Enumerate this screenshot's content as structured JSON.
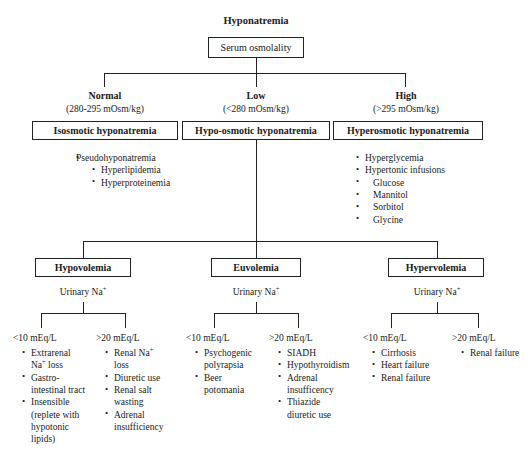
{
  "title": "Hyponatremia",
  "root_box": "Serum osmolality",
  "osmolality_branches": [
    {
      "label": "Normal",
      "range": "(280-295 mOsm/kg)"
    },
    {
      "label": "Low",
      "range": "(<280 mOsm/kg)"
    },
    {
      "label": "High",
      "range": "(>295 mOsm/kg)"
    }
  ],
  "category_boxes": [
    {
      "label": "Isosmotic hyponatremia"
    },
    {
      "label": "Hypo-osmotic hyponatremia"
    },
    {
      "label": "Hyperosmotic hyponatremia"
    }
  ],
  "isosmotic_list": [
    {
      "text": "Pseudohyponatremia",
      "style": "plain"
    },
    {
      "text": "Hyperlipidemia",
      "style": "bullet"
    },
    {
      "text": "Hyperproteinemia",
      "style": "bullet"
    }
  ],
  "hyperosmotic_list": [
    {
      "text": "Hyperglycemia",
      "style": "bullet"
    },
    {
      "text": "Hypertonic infusions",
      "style": "bullet"
    },
    {
      "text": "Glucose",
      "style": "sub"
    },
    {
      "text": "Mannitol",
      "style": "sub"
    },
    {
      "text": "Sorbitol",
      "style": "sub"
    },
    {
      "text": "Glycine",
      "style": "sub"
    }
  ],
  "volume_boxes": [
    {
      "label": "Hypovolemia"
    },
    {
      "label": "Euvolemia"
    },
    {
      "label": "Hypervolemia"
    }
  ],
  "urinary_na_label": "Urinary Na",
  "urinary_na_sup": "+",
  "thresholds": {
    "low": "<10 mEq/L",
    "high": ">20 mEq/L"
  },
  "columns": {
    "hypovolemia": {
      "low": [
        {
          "lines": [
            "Extrarenal",
            "Na⁺ loss"
          ],
          "style": "bullet"
        },
        {
          "lines": [
            "Gastro-",
            "intestinal tract"
          ],
          "style": "bullet"
        },
        {
          "lines": [
            "Insensible",
            "(replete with",
            "hypotonic",
            "lipids)"
          ],
          "style": "bullet"
        }
      ],
      "high": [
        {
          "lines": [
            "Renal Na⁺",
            "loss"
          ],
          "style": "bullet"
        },
        {
          "lines": [
            "Diuretic use"
          ],
          "style": "bullet"
        },
        {
          "lines": [
            "Renal salt",
            "wasting"
          ],
          "style": "bullet"
        },
        {
          "lines": [
            "Adrenal",
            "insufficiency"
          ],
          "style": "bullet"
        }
      ]
    },
    "euvolemia": {
      "low": [
        {
          "lines": [
            "Psychogenic",
            "polyrapsia"
          ],
          "style": "bullet"
        },
        {
          "lines": [
            "Beer",
            "potomania"
          ],
          "style": "bullet"
        }
      ],
      "high": [
        {
          "lines": [
            "SIADH"
          ],
          "style": "bullet"
        },
        {
          "lines": [
            "Hypothyroidism"
          ],
          "style": "bullet"
        },
        {
          "lines": [
            "Adrenal",
            "insufficency"
          ],
          "style": "bullet"
        },
        {
          "lines": [
            "Thiazide",
            "diuretic use"
          ],
          "style": "bullet"
        }
      ]
    },
    "hypervolemia": {
      "low": [
        {
          "lines": [
            "Cirrhosis"
          ],
          "style": "bullet"
        },
        {
          "lines": [
            "Heart failure"
          ],
          "style": "bullet"
        },
        {
          "lines": [
            "Renal failure"
          ],
          "style": "bullet"
        }
      ],
      "high": [
        {
          "lines": [
            "Renal failure"
          ],
          "style": "bullet"
        }
      ]
    }
  },
  "colors": {
    "line": "#222222",
    "text": "#1a1a1a",
    "background": "#ffffff"
  }
}
